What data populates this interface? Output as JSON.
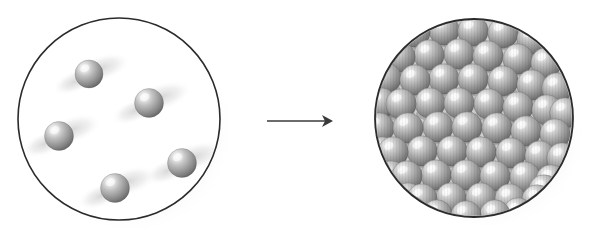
{
  "figure": {
    "type": "scientific-illustration",
    "width": 603,
    "height": 251,
    "background_color": "#ffffff"
  },
  "colors": {
    "outline": "#2b2b2b",
    "vessel_fill": "#ffffff",
    "sphere_light": "#f2f2f2",
    "sphere_mid": "#9a9a9a",
    "sphere_dark": "#5a5a5a",
    "sphere_edge": "#4a4a4a",
    "shadow": "#c9c9c9",
    "arrow": "#3a3a3a"
  },
  "left_vessel": {
    "label": "dilute-phase-vessel",
    "cx": 119,
    "cy": 119,
    "r": 101,
    "stroke_width": 1.6,
    "particle_count": 5,
    "particle_radius": 14,
    "particles": [
      {
        "cx": 89,
        "cy": 74,
        "r": 14
      },
      {
        "cx": 149,
        "cy": 103,
        "r": 14.5
      },
      {
        "cx": 59,
        "cy": 136,
        "r": 14.5
      },
      {
        "cx": 182,
        "cy": 163,
        "r": 14.5
      },
      {
        "cx": 115,
        "cy": 188,
        "r": 14.5
      }
    ]
  },
  "arrow": {
    "label": "transition-arrow",
    "direction": "right",
    "x1": 267,
    "x2": 333,
    "y": 121,
    "stroke_width": 1.6,
    "head_length": 11,
    "head_half_width": 6
  },
  "right_vessel": {
    "label": "condensed-phase-vessel",
    "cx": 474,
    "cy": 118,
    "r": 99,
    "stroke_width": 1.8,
    "particle_radius": 15.2,
    "row_spacing": 25.5,
    "col_spacing": 29.5,
    "particle_count": 61,
    "particles": [
      {
        "cx": 415,
        "cy": 32,
        "r": 15.2
      },
      {
        "cx": 444,
        "cy": 30,
        "r": 15.2
      },
      {
        "cx": 473,
        "cy": 31,
        "r": 15.2
      },
      {
        "cx": 503,
        "cy": 33,
        "r": 15.2
      },
      {
        "cx": 532,
        "cy": 39,
        "r": 15.2
      },
      {
        "cx": 392,
        "cy": 47,
        "r": 15.2
      },
      {
        "cx": 400,
        "cy": 57,
        "r": 15.2
      },
      {
        "cx": 429,
        "cy": 55,
        "r": 15.2
      },
      {
        "cx": 459,
        "cy": 54,
        "r": 15.2
      },
      {
        "cx": 488,
        "cy": 56,
        "r": 15.2
      },
      {
        "cx": 518,
        "cy": 59,
        "r": 15.2
      },
      {
        "cx": 546,
        "cy": 63,
        "r": 15.2
      },
      {
        "cx": 386,
        "cy": 78,
        "r": 15.2
      },
      {
        "cx": 415,
        "cy": 80,
        "r": 15.2
      },
      {
        "cx": 444,
        "cy": 79,
        "r": 15.2
      },
      {
        "cx": 473,
        "cy": 79,
        "r": 15.2
      },
      {
        "cx": 503,
        "cy": 81,
        "r": 15.2
      },
      {
        "cx": 532,
        "cy": 85,
        "r": 15.2
      },
      {
        "cx": 557,
        "cy": 88,
        "r": 15.2
      },
      {
        "cx": 381,
        "cy": 103,
        "r": 15.2
      },
      {
        "cx": 401,
        "cy": 104,
        "r": 15.2
      },
      {
        "cx": 430,
        "cy": 103,
        "r": 15.2
      },
      {
        "cx": 459,
        "cy": 103,
        "r": 15.2
      },
      {
        "cx": 489,
        "cy": 104,
        "r": 15.2
      },
      {
        "cx": 518,
        "cy": 107,
        "r": 15.2
      },
      {
        "cx": 547,
        "cy": 110,
        "r": 15.2
      },
      {
        "cx": 565,
        "cy": 113,
        "r": 15.2
      },
      {
        "cx": 379,
        "cy": 128,
        "r": 15.2
      },
      {
        "cx": 408,
        "cy": 128,
        "r": 15.2
      },
      {
        "cx": 438,
        "cy": 127,
        "r": 15.2
      },
      {
        "cx": 467,
        "cy": 127,
        "r": 15.2
      },
      {
        "cx": 497,
        "cy": 128,
        "r": 15.2
      },
      {
        "cx": 526,
        "cy": 131,
        "r": 15.2
      },
      {
        "cx": 555,
        "cy": 134,
        "r": 15.2
      },
      {
        "cx": 382,
        "cy": 152,
        "r": 15.2
      },
      {
        "cx": 393,
        "cy": 152,
        "r": 15.2
      },
      {
        "cx": 422,
        "cy": 151,
        "r": 15.2
      },
      {
        "cx": 452,
        "cy": 151,
        "r": 15.2
      },
      {
        "cx": 481,
        "cy": 152,
        "r": 15.2
      },
      {
        "cx": 511,
        "cy": 153,
        "r": 15.2
      },
      {
        "cx": 540,
        "cy": 156,
        "r": 15.2
      },
      {
        "cx": 562,
        "cy": 158,
        "r": 15.2
      },
      {
        "cx": 391,
        "cy": 176,
        "r": 15.2
      },
      {
        "cx": 407,
        "cy": 176,
        "r": 15.2
      },
      {
        "cx": 436,
        "cy": 175,
        "r": 15.2
      },
      {
        "cx": 466,
        "cy": 175,
        "r": 15.2
      },
      {
        "cx": 495,
        "cy": 176,
        "r": 15.2
      },
      {
        "cx": 525,
        "cy": 177,
        "r": 15.2
      },
      {
        "cx": 551,
        "cy": 180,
        "r": 15.2
      },
      {
        "cx": 408,
        "cy": 198,
        "r": 15.2
      },
      {
        "cx": 422,
        "cy": 199,
        "r": 15.2
      },
      {
        "cx": 451,
        "cy": 198,
        "r": 15.2
      },
      {
        "cx": 481,
        "cy": 198,
        "r": 15.2
      },
      {
        "cx": 510,
        "cy": 199,
        "r": 15.2
      },
      {
        "cx": 537,
        "cy": 200,
        "r": 15.2
      },
      {
        "cx": 437,
        "cy": 215,
        "r": 15.2
      },
      {
        "cx": 466,
        "cy": 216,
        "r": 15.2
      },
      {
        "cx": 495,
        "cy": 215,
        "r": 15.2
      },
      {
        "cx": 518,
        "cy": 213,
        "r": 15.2
      },
      {
        "cx": 412,
        "cy": 212,
        "r": 15.2
      },
      {
        "cx": 544,
        "cy": 190,
        "r": 15.2
      }
    ]
  }
}
